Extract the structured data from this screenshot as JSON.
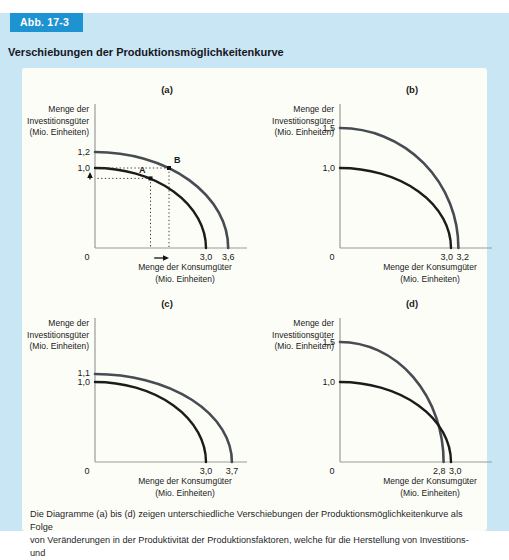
{
  "figure": {
    "badge": "Abb. 17-3",
    "title": "Verschiebungen der Produktionsmöglichkeitenkurve",
    "caption_line1": "Die Diagramme (a) bis (d) zeigen unterschiedliche Verschiebungen der Produktionsmöglichkeitenkurve als Folge",
    "caption_line2": "von Veränderungen in der Produktivität der Produktionsfaktoren, welche für die Herstellung von Investitions- und"
  },
  "colors": {
    "page_bg": "#c9e6f5",
    "badge_bg": "#1d93d2",
    "badge_text": "#ffffff",
    "panel_bg": "#fdfdf8",
    "curve_original": "#1b1b1b",
    "curve_shifted": "#474c53",
    "axis": "#9a9a9a",
    "guide": "#3a3a3a",
    "text": "#1a1a1a"
  },
  "chart_data": {
    "type": "line",
    "subtype": "production-possibility-frontier",
    "title": "Verschiebungen der Produktionsmöglichkeitenkurve",
    "ylabel_lines": [
      "Menge der",
      "Investitionsgüter",
      "(Mio. Einheiten)"
    ],
    "xlabel_lines": [
      "Menge der Konsumgüter",
      "(Mio. Einheiten)"
    ],
    "origin_label": "0",
    "xlim": [
      0,
      4.1
    ],
    "ylim": [
      0,
      1.8
    ],
    "grid": false,
    "panels": [
      {
        "id": "a",
        "label": "(a)",
        "curves": [
          {
            "name": "original",
            "x_intercept": 3.0,
            "y_intercept": 1.0,
            "color_key": "curve_original"
          },
          {
            "name": "shifted",
            "x_intercept": 3.6,
            "y_intercept": 1.2,
            "color_key": "curve_shifted"
          }
        ],
        "y_ticks": [
          {
            "value": 1.2,
            "label": "1,2"
          },
          {
            "value": 1.0,
            "label": "1,0"
          }
        ],
        "x_ticks": [
          {
            "value": 3.0,
            "label": "3,0"
          },
          {
            "value": 3.6,
            "label": "3,6"
          }
        ],
        "points": [
          {
            "name": "A",
            "x": 1.5,
            "y": 0.87,
            "label_side": "left"
          },
          {
            "name": "B",
            "x": 2.0,
            "y": 1.0,
            "label_side": "right"
          }
        ],
        "arrows": {
          "x_shift": {
            "from": 1.6,
            "to": 2.0
          },
          "y_shift": {
            "from": 0.87,
            "to": 1.0
          }
        }
      },
      {
        "id": "b",
        "label": "(b)",
        "curves": [
          {
            "name": "original",
            "x_intercept": 3.0,
            "y_intercept": 1.0,
            "color_key": "curve_original"
          },
          {
            "name": "shifted",
            "x_intercept": 3.2,
            "y_intercept": 1.5,
            "color_key": "curve_shifted"
          }
        ],
        "y_ticks": [
          {
            "value": 1.5,
            "label": "1,5"
          },
          {
            "value": 1.0,
            "label": "1,0"
          }
        ],
        "x_ticks": [
          {
            "value": 3.0,
            "label": "3,0"
          },
          {
            "value": 3.2,
            "label": "3,2"
          }
        ]
      },
      {
        "id": "c",
        "label": "(c)",
        "curves": [
          {
            "name": "original",
            "x_intercept": 3.0,
            "y_intercept": 1.0,
            "color_key": "curve_original"
          },
          {
            "name": "shifted",
            "x_intercept": 3.7,
            "y_intercept": 1.1,
            "color_key": "curve_shifted"
          }
        ],
        "y_ticks": [
          {
            "value": 1.1,
            "label": "1,1"
          },
          {
            "value": 1.0,
            "label": "1,0"
          }
        ],
        "x_ticks": [
          {
            "value": 3.0,
            "label": "3,0"
          },
          {
            "value": 3.7,
            "label": "3,7"
          }
        ]
      },
      {
        "id": "d",
        "label": "(d)",
        "curves": [
          {
            "name": "original",
            "x_intercept": 3.0,
            "y_intercept": 1.0,
            "color_key": "curve_original"
          },
          {
            "name": "shifted",
            "x_intercept": 2.8,
            "y_intercept": 1.5,
            "color_key": "curve_shifted"
          }
        ],
        "y_ticks": [
          {
            "value": 1.5,
            "label": "1,5"
          },
          {
            "value": 1.0,
            "label": "1,0"
          }
        ],
        "x_ticks": [
          {
            "value": 2.8,
            "label": "2,8"
          },
          {
            "value": 3.0,
            "label": "3,0"
          }
        ]
      }
    ]
  }
}
